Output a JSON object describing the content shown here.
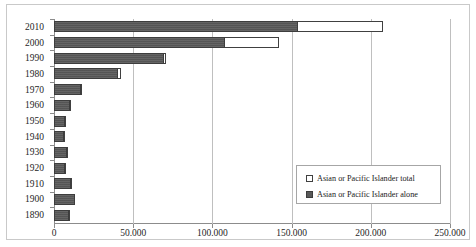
{
  "chart_data": {
    "type": "bar",
    "orientation": "horizontal",
    "title": "",
    "xlabel": "",
    "ylabel": "",
    "xlim": [
      0,
      250000
    ],
    "xticks": [
      0,
      50000,
      100000,
      150000,
      200000,
      250000
    ],
    "xtick_labels": [
      "0",
      "50.000",
      "100.000",
      "150.000",
      "200.000",
      "250.000"
    ],
    "grid": "vertical",
    "legend_position": "bottom-right",
    "categories": [
      "2010",
      "2000",
      "1990",
      "1980",
      "1970",
      "1960",
      "1950",
      "1940",
      "1930",
      "1920",
      "1910",
      "1900",
      "1890"
    ],
    "series": [
      {
        "name": "Asian or Pacific Islander total",
        "style": "hollow",
        "color": "#ffffff",
        "values": [
          208000,
          142000,
          71000,
          42000,
          17500,
          10500,
          7500,
          7000,
          9000,
          7500,
          11500,
          13500,
          10000
        ]
      },
      {
        "name": "Asian or Pacific Islander alone",
        "style": "filled",
        "color": "#595959",
        "values": [
          154000,
          108000,
          69500,
          40500,
          17000,
          10000,
          7000,
          6500,
          8500,
          7000,
          11000,
          13000,
          9500
        ]
      }
    ]
  },
  "legend": {
    "items": [
      {
        "label": "Asian or Pacific Islander total",
        "swatch": "hollow-square-icon"
      },
      {
        "label": "Asian or Pacific Islander alone",
        "swatch": "filled-square-icon"
      }
    ]
  }
}
